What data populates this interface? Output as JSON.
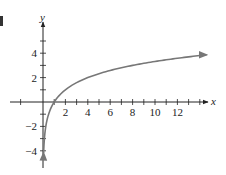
{
  "chart_data": {
    "type": "line",
    "title": "",
    "function": "y = log2(x)",
    "xlabel": "x",
    "ylabel": "y",
    "xlim": [
      0,
      14.6
    ],
    "ylim": [
      -5,
      6
    ],
    "x_ticks": [
      1,
      2,
      3,
      4,
      5,
      6,
      7,
      8,
      9,
      10,
      11,
      12,
      13,
      14
    ],
    "x_tick_labels": [
      "2",
      "4",
      "6",
      "8",
      "10",
      "12"
    ],
    "x_tick_label_values": [
      2,
      4,
      6,
      8,
      10,
      12
    ],
    "y_ticks": [
      -4,
      -3,
      -2,
      -1,
      1,
      2,
      3,
      4,
      5
    ],
    "y_tick_labels": [
      "4",
      "2",
      "-2",
      "-4"
    ],
    "y_tick_label_values": [
      4,
      2,
      -2,
      -4
    ],
    "grid": false,
    "series": [
      {
        "name": "log2(x)",
        "x": [
          0.06,
          0.125,
          0.25,
          0.5,
          1,
          2,
          4,
          8,
          14.6
        ],
        "values": [
          -4.06,
          -3,
          -2,
          -1,
          0,
          1,
          2,
          3,
          3.87
        ],
        "color": "#777777"
      }
    ],
    "annotations": [
      "arrow at right end of curve",
      "arrow at bottom end of curve"
    ]
  },
  "colors": {
    "axis": "#222222",
    "curve": "#777777",
    "text": "#222222"
  },
  "fragment_label": ")"
}
